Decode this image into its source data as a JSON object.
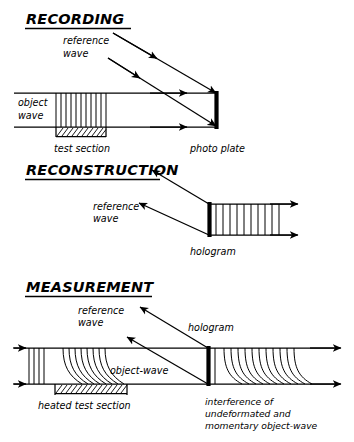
{
  "figure": {
    "kind": "line-diagram",
    "title_style": "underlined-italic-caps",
    "colors": {
      "ink": "#000000",
      "paper": "#ffffff"
    },
    "panels": [
      {
        "id": "recording",
        "title": "RECORDING",
        "labels": {
          "reference_wave_line1": "reference",
          "reference_wave_line2": "wave",
          "object_wave_line1": "object",
          "object_wave_line2": "wave",
          "test_section": "test section",
          "photo_plate": "photo plate"
        },
        "elements": [
          "object-wave-channel",
          "plane-wavefronts",
          "hatched-test-section",
          "reference-wave-arrows-incoming",
          "object-wave-arrows-right",
          "photo-plate-bar"
        ],
        "reference_wave_direction": "down-right (toward plate)",
        "object_wave_direction": "left-to-right",
        "wavefront_count": 11,
        "wavefront_shape": "straight vertical (undisturbed)"
      },
      {
        "id": "reconstruction",
        "title": "RECONSTRUCTION",
        "labels": {
          "reference_wave_line1": "reference",
          "reference_wave_line2": "wave",
          "hologram": "hologram"
        },
        "elements": [
          "reference-wave-arrows-outgoing",
          "hologram-bar",
          "reconstructed-wave-channel",
          "plane-wavefronts",
          "output-arrows-right"
        ],
        "reference_wave_direction": "up-left (illuminating from lower right)",
        "wavefront_count": 10,
        "wavefront_shape": "straight vertical (reconstructed undeformed)"
      },
      {
        "id": "measurement",
        "title": "MEASUREMENT",
        "labels": {
          "reference_wave_line1": "reference",
          "reference_wave_line2": "wave",
          "object_wave": "object-wave",
          "hologram": "hologram",
          "heated_test_section": "heated test section",
          "interference_line1": "interference of",
          "interference_line2": "undeformated and",
          "interference_line3": "momentary object-wave"
        },
        "elements": [
          "object-wave-channel",
          "straight-wavefronts-left",
          "deformed-curved-wavefronts",
          "hatched-heated-test-section",
          "reference-wave-arrows-outgoing",
          "hologram-bar",
          "interference-fringe-pattern",
          "output-arrows-right"
        ],
        "reference_wave_direction": "up-left",
        "wavefront_shape_left": "straight vertical",
        "wavefront_shape_over_heater": "curved / bent by thermal gradient",
        "wavefront_shape_right": "interference fringes (hooked)"
      }
    ]
  }
}
